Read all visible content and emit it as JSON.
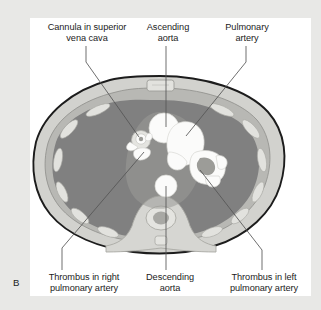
{
  "figure": {
    "panel_letter": "B",
    "background_color": "#e8e8e6",
    "panel_color": "#ffffff",
    "line_color": "#555555",
    "text_color": "#1b1b1b"
  },
  "labels": {
    "cannula": "Cannula in superior\nvena cava",
    "ascending_aorta": "Ascending\naorta",
    "pulmonary_artery": "Pulmonary\nartery",
    "thrombus_right": "Thrombus in right\npulmonary artery",
    "descending_aorta": "Descending\naorta",
    "thrombus_left": "Thrombus in left\npulmonary artery"
  },
  "anatomy": {
    "body_outline_color": "#1c1c1c",
    "subcutaneous_fat_color": "#d2d2ce",
    "muscle_color": "#b8b8b4",
    "bone_color": "#e2e2de",
    "lung_field_color": "#808080",
    "vessel_color": "#fbfbfa",
    "mediastinum_color": "#9a9a97",
    "structures": [
      "superior vena cava with cannula",
      "ascending aorta",
      "main pulmonary artery",
      "right pulmonary artery with thrombus",
      "left pulmonary artery with thrombus",
      "descending aorta",
      "vertebral body",
      "spinal canal",
      "sternum",
      "ribs",
      "left lung",
      "right lung"
    ]
  }
}
